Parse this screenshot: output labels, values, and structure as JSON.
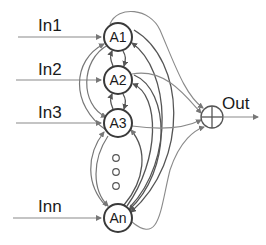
{
  "diagram": {
    "type": "recurrent-neural-network",
    "inputs": [
      {
        "id": "in1",
        "label": "In1",
        "target": "A1"
      },
      {
        "id": "in2",
        "label": "In2",
        "target": "A2"
      },
      {
        "id": "in3",
        "label": "In3",
        "target": "A3"
      },
      {
        "id": "inn",
        "label": "Inn",
        "target": "An"
      }
    ],
    "nodes": [
      {
        "id": "A1",
        "label": "A1"
      },
      {
        "id": "A2",
        "label": "A2"
      },
      {
        "id": "A3",
        "label": "A3"
      },
      {
        "id": "An",
        "label": "An"
      }
    ],
    "ellipsis": "vertical dots (more nodes)",
    "summing_junction": {
      "symbol": "circle-plus"
    },
    "output": {
      "label": "Out"
    },
    "colors": {
      "node_stroke": "#3a3a3a",
      "edge_dark": "#555555",
      "edge_light": "#8a8a8a",
      "text": "#1a1a1a"
    }
  }
}
